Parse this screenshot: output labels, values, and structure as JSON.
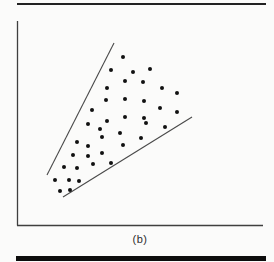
{
  "figure": {
    "caption": "(b)"
  },
  "colors": {
    "background": "#fbfbfa",
    "axis": "#3f3f3f",
    "boundary_line": "#4a4a4a",
    "dot": "#111111",
    "top_rule": "#222222",
    "bottom_rule": "#0d0d0d",
    "caption_text": "#2b2b2b"
  },
  "rules": {
    "top": {
      "x1": 17,
      "x2": 266,
      "y": 4,
      "thickness": 2
    },
    "bottom": {
      "x1": 16,
      "x2": 266,
      "y": 258.5,
      "thickness": 5
    }
  },
  "chart_data": {
    "type": "scatter",
    "title": "",
    "xlabel": "",
    "ylabel": "",
    "caption": "(b)",
    "grid": false,
    "tick_labels": "none",
    "axes": {
      "y_axis_px": {
        "x": 17.5,
        "y1": 21,
        "y2": 225.5
      },
      "x_axis_px": {
        "y": 225.5,
        "x1": 17,
        "x2": 263
      }
    },
    "boundary_lines_px": [
      {
        "name": "upper-boundary-line",
        "x1": 114,
        "y1": 43,
        "x2": 47,
        "y2": 175
      },
      {
        "name": "lower-boundary-line",
        "x1": 63,
        "y1": 197,
        "x2": 192,
        "y2": 117
      }
    ],
    "point_radius_px": 2,
    "points_px": [
      [
        123,
        57
      ],
      [
        111,
        70
      ],
      [
        133,
        72
      ],
      [
        150,
        69
      ],
      [
        125,
        81
      ],
      [
        143,
        82
      ],
      [
        107,
        88
      ],
      [
        162,
        88
      ],
      [
        177,
        93
      ],
      [
        106,
        100
      ],
      [
        125,
        99
      ],
      [
        144,
        101
      ],
      [
        160,
        108
      ],
      [
        177,
        112
      ],
      [
        92,
        110
      ],
      [
        107,
        121
      ],
      [
        125,
        117
      ],
      [
        144,
        118
      ],
      [
        88,
        124
      ],
      [
        100,
        129
      ],
      [
        120,
        133
      ],
      [
        146,
        123
      ],
      [
        165,
        127
      ],
      [
        141,
        138
      ],
      [
        77,
        142
      ],
      [
        88,
        146
      ],
      [
        102,
        137
      ],
      [
        123,
        145
      ],
      [
        73,
        155
      ],
      [
        88,
        156
      ],
      [
        102,
        153
      ],
      [
        64,
        167
      ],
      [
        77,
        168
      ],
      [
        93,
        164
      ],
      [
        111,
        163
      ],
      [
        55,
        180
      ],
      [
        69,
        180
      ],
      [
        79,
        181
      ],
      [
        60,
        191
      ],
      [
        70,
        190
      ]
    ]
  }
}
